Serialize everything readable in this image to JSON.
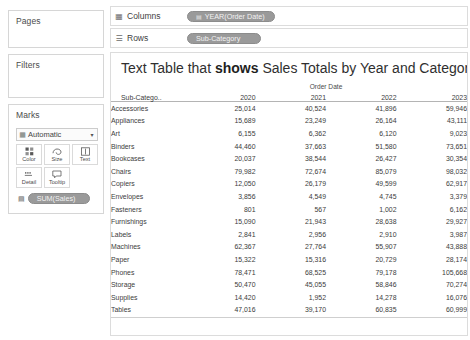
{
  "left_rail": {
    "pages": {
      "title": "Pages"
    },
    "filters": {
      "title": "Filters"
    },
    "marks": {
      "title": "Marks",
      "type_selector": {
        "value": "Automatic",
        "icon": "marks-type-icon",
        "arrow": "▾"
      },
      "buttons": [
        {
          "label": "Color",
          "icon": "color-palette-icon"
        },
        {
          "label": "Size",
          "icon": "size-icon"
        },
        {
          "label": "Text",
          "icon": "text-icon"
        },
        {
          "label": "Detail",
          "icon": "detail-icon"
        },
        {
          "label": "Tooltip",
          "icon": "tooltip-icon"
        }
      ],
      "pill": {
        "label": "SUM(Sales)",
        "icon": "abc-icon"
      }
    }
  },
  "shelves": {
    "columns": {
      "label": "Columns",
      "icon": "columns-icon",
      "pill": {
        "label": "YEAR(Order Date)",
        "icon": "date-icon"
      }
    },
    "rows": {
      "label": "Rows",
      "icon": "rows-icon",
      "pill": {
        "label": "Sub-Category",
        "icon": ""
      }
    }
  },
  "viz": {
    "title_prefix": "Text Table that ",
    "title_bold": "shows",
    "title_suffix": " Sales Totals by Year and Category"
  },
  "chart_data": {
    "type": "table",
    "title": "Text Table that shows Sales Totals by Year and Category",
    "column_group_header": "Order Date",
    "row_header": "Sub-Catego..",
    "categories": [
      "2020",
      "2021",
      "2022",
      "2023"
    ],
    "xlabel": "Order Date",
    "ylabel": "Sub-Category",
    "rows": [
      {
        "label": "Accessories",
        "values": [
          "25,014",
          "40,524",
          "41,896",
          "59,946"
        ]
      },
      {
        "label": "Appliances",
        "values": [
          "15,689",
          "23,249",
          "26,164",
          "43,111"
        ]
      },
      {
        "label": "Art",
        "values": [
          "6,155",
          "6,362",
          "6,120",
          "9,023"
        ]
      },
      {
        "label": "Binders",
        "values": [
          "44,460",
          "37,663",
          "51,580",
          "73,651"
        ]
      },
      {
        "label": "Bookcases",
        "values": [
          "20,037",
          "38,544",
          "26,427",
          "30,354"
        ]
      },
      {
        "label": "Chairs",
        "values": [
          "79,982",
          "72,674",
          "85,079",
          "98,032"
        ]
      },
      {
        "label": "Copiers",
        "values": [
          "12,050",
          "26,179",
          "49,599",
          "62,917"
        ]
      },
      {
        "label": "Envelopes",
        "values": [
          "3,856",
          "4,549",
          "4,745",
          "3,379"
        ]
      },
      {
        "label": "Fasteners",
        "values": [
          "801",
          "567",
          "1,002",
          "6,162"
        ]
      },
      {
        "label": "Furnishings",
        "values": [
          "15,090",
          "21,943",
          "28,638",
          "29,927"
        ]
      },
      {
        "label": "Labels",
        "values": [
          "2,841",
          "2,956",
          "2,910",
          "3,987"
        ]
      },
      {
        "label": "Machines",
        "values": [
          "62,367",
          "27,764",
          "55,907",
          "43,888"
        ]
      },
      {
        "label": "Paper",
        "values": [
          "15,322",
          "15,316",
          "20,729",
          "28,174"
        ]
      },
      {
        "label": "Phones",
        "values": [
          "78,471",
          "68,525",
          "79,178",
          "105,668"
        ]
      },
      {
        "label": "Storage",
        "values": [
          "50,470",
          "45,055",
          "58,846",
          "70,274"
        ]
      },
      {
        "label": "Supplies",
        "values": [
          "14,420",
          "1,952",
          "14,278",
          "16,076"
        ]
      },
      {
        "label": "Tables",
        "values": [
          "47,016",
          "39,170",
          "60,835",
          "60,999"
        ]
      }
    ]
  },
  "colors": {
    "pill_fill": "#9a9a9a",
    "pill_text": "#f2f2f2",
    "panel_border": "#dcdcdc",
    "text": "#3c3c3c"
  }
}
